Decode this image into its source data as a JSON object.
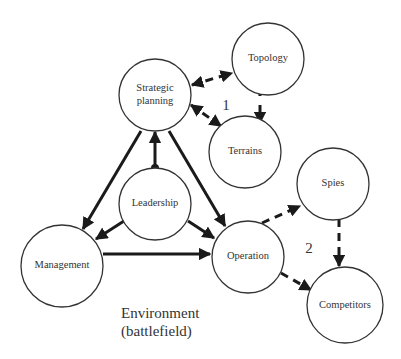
{
  "diagram": {
    "nodes": [
      {
        "id": "strategic",
        "label_lines": [
          "Strategic",
          "planning"
        ]
      },
      {
        "id": "topology",
        "label_lines": [
          "Topology"
        ]
      },
      {
        "id": "terrains",
        "label_lines": [
          "Terrains"
        ]
      },
      {
        "id": "leadership",
        "label_lines": [
          "Leadership"
        ]
      },
      {
        "id": "spies",
        "label_lines": [
          "Spies"
        ]
      },
      {
        "id": "management",
        "label_lines": [
          "Management"
        ]
      },
      {
        "id": "operation",
        "label_lines": [
          "Operation"
        ]
      },
      {
        "id": "competitors",
        "label_lines": [
          "Competitors"
        ]
      }
    ],
    "group_labels": {
      "group1": "1",
      "group2": "2"
    },
    "environment_label": [
      "Environment",
      "(battlefield)"
    ],
    "edges": [
      {
        "from": "strategic",
        "to": "topology",
        "style": "dashed",
        "direction": "both"
      },
      {
        "from": "strategic",
        "to": "terrains",
        "style": "dashed",
        "direction": "both"
      },
      {
        "from": "topology",
        "to": "terrains",
        "style": "solid",
        "direction": "both"
      },
      {
        "from": "leadership",
        "to": "strategic",
        "style": "solid",
        "direction": "forward"
      },
      {
        "from": "strategic",
        "to": "management",
        "style": "solid",
        "direction": "forward"
      },
      {
        "from": "strategic",
        "to": "operation",
        "style": "solid",
        "direction": "forward"
      },
      {
        "from": "leadership",
        "to": "management",
        "style": "solid",
        "direction": "forward"
      },
      {
        "from": "leadership",
        "to": "operation",
        "style": "solid",
        "direction": "forward"
      },
      {
        "from": "management",
        "to": "operation",
        "style": "solid",
        "direction": "forward"
      },
      {
        "from": "operation",
        "to": "spies",
        "style": "dashed",
        "direction": "forward"
      },
      {
        "from": "operation",
        "to": "competitors",
        "style": "dashed",
        "direction": "forward"
      },
      {
        "from": "spies",
        "to": "competitors",
        "style": "dashed",
        "direction": "forward"
      }
    ]
  }
}
